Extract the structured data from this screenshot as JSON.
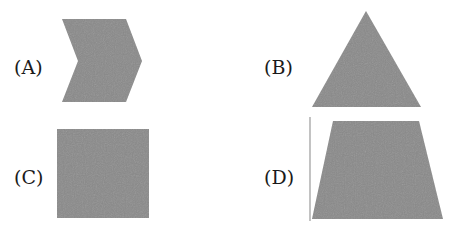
{
  "options": [
    {
      "id": "A",
      "label": "(A)",
      "shape": "chevron-arrow"
    },
    {
      "id": "B",
      "label": "(B)",
      "shape": "triangle"
    },
    {
      "id": "C",
      "label": "(C)",
      "shape": "square"
    },
    {
      "id": "D",
      "label": "(D)",
      "shape": "trapezoid"
    }
  ],
  "colors": {
    "shape_fill": "#8a8a8a",
    "label_text": "#1a1a1a",
    "line": "#9a9a9a",
    "background": "#ffffff"
  }
}
